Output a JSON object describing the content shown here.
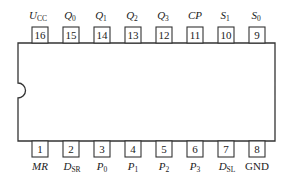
{
  "diagram": {
    "type": "ic-pinout",
    "package": "DIP-16",
    "top_pins": [
      {
        "number": "16",
        "label": "U",
        "sub": "CC"
      },
      {
        "number": "15",
        "label": "Q",
        "sub": "0"
      },
      {
        "number": "14",
        "label": "Q",
        "sub": "1"
      },
      {
        "number": "13",
        "label": "Q",
        "sub": "2"
      },
      {
        "number": "12",
        "label": "Q",
        "sub": "3"
      },
      {
        "number": "11",
        "label": "CP",
        "sub": ""
      },
      {
        "number": "10",
        "label": "S",
        "sub": "1"
      },
      {
        "number": "9",
        "label": "S",
        "sub": "0"
      }
    ],
    "bottom_pins": [
      {
        "number": "1",
        "label": "MR",
        "sub": ""
      },
      {
        "number": "2",
        "label": "D",
        "sub": "SR"
      },
      {
        "number": "3",
        "label": "P",
        "sub": "0"
      },
      {
        "number": "4",
        "label": "P",
        "sub": "1"
      },
      {
        "number": "5",
        "label": "P",
        "sub": "2"
      },
      {
        "number": "6",
        "label": "P",
        "sub": "3"
      },
      {
        "number": "7",
        "label": "D",
        "sub": "SL"
      },
      {
        "number": "8",
        "label": "GND",
        "sub": ""
      }
    ],
    "colors": {
      "stroke": "#333333",
      "background": "#ffffff"
    }
  }
}
